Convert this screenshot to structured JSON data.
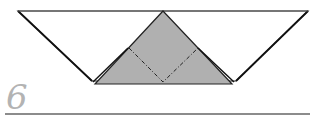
{
  "step": {
    "number": "6"
  },
  "colors": {
    "paper_white": "#ffffff",
    "paper_grey": "#b0b0b0",
    "outline": "#222222",
    "step_number": "#b3b3b3",
    "rule": "#8c8c8c"
  }
}
